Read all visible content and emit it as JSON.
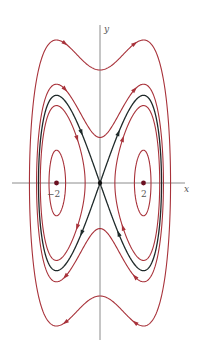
{
  "chart_data": {
    "type": "line",
    "title": "",
    "xlabel": "x",
    "ylabel": "y",
    "xlim": [
      -3.8,
      3.9
    ],
    "ylim": [
      -2.6,
      2.55
    ],
    "x_ticks": [
      {
        "value": -2,
        "label": "−2"
      },
      {
        "value": 2,
        "label": "2"
      }
    ],
    "equilibria": [
      {
        "x": -2,
        "y": 0,
        "type": "center"
      },
      {
        "x": 0,
        "y": 0,
        "type": "saddle"
      },
      {
        "x": 2,
        "y": 0,
        "type": "center"
      }
    ],
    "hamiltonian": "H = y^2/2 - x^2/2 + x^4/16",
    "series": [
      {
        "name": "outer-orbit",
        "level": 1.66,
        "color": "#a8323a",
        "kind": "orbit"
      },
      {
        "name": "orbit-outside-separatrix",
        "level": 0.27,
        "color": "#a8323a",
        "kind": "orbit"
      },
      {
        "name": "separatrix",
        "level": 0,
        "color": "#1f2a2a",
        "kind": "separatrix"
      },
      {
        "name": "orbit-inside-separatrix",
        "level": -0.22,
        "color": "#a8323a",
        "kind": "orbit"
      },
      {
        "name": "small-orbit",
        "level": -0.86,
        "color": "#a8323a",
        "kind": "orbit"
      }
    ],
    "colors": {
      "orbit": "#a8323a",
      "separatrix": "#1f2a2a",
      "axis": "#6e6e6e",
      "point": "#6b1020"
    }
  }
}
